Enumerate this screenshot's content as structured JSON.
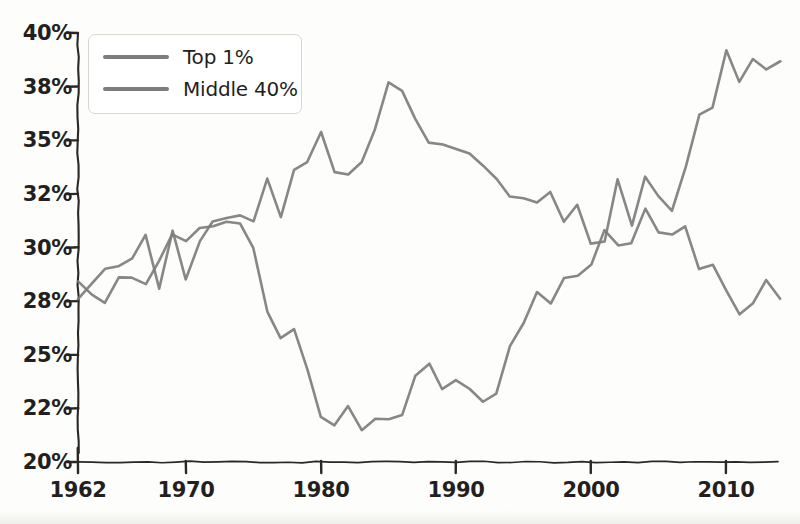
{
  "chart_data": {
    "type": "line",
    "title": "",
    "subtitle": "",
    "xlabel": "",
    "ylabel": "",
    "xlim": [
      1962,
      2014
    ],
    "ylim": [
      20,
      40
    ],
    "grid": false,
    "legend_position": "top-left",
    "x_ticks": [
      {
        "value": 1962,
        "label": "1962"
      },
      {
        "value": 1970,
        "label": "1970"
      },
      {
        "value": 1980,
        "label": "1980"
      },
      {
        "value": 1990,
        "label": "1990"
      },
      {
        "value": 2000,
        "label": "2000"
      },
      {
        "value": 2010,
        "label": "2010"
      }
    ],
    "y_ticks": [
      {
        "value": 40.0,
        "label": "40%"
      },
      {
        "value": 37.5,
        "label": "38%"
      },
      {
        "value": 35.0,
        "label": "35%"
      },
      {
        "value": 32.5,
        "label": "32%"
      },
      {
        "value": 30.0,
        "label": "30%"
      },
      {
        "value": 27.5,
        "label": "28%"
      },
      {
        "value": 25.0,
        "label": "25%"
      },
      {
        "value": 22.5,
        "label": "22%"
      },
      {
        "value": 20.0,
        "label": "20%"
      }
    ],
    "x": [
      1962,
      1963,
      1964,
      1965,
      1966,
      1967,
      1968,
      1969,
      1970,
      1971,
      1972,
      1973,
      1974,
      1975,
      1976,
      1977,
      1978,
      1979,
      1980,
      1981,
      1982,
      1983,
      1984,
      1985,
      1986,
      1987,
      1988,
      1989,
      1990,
      1991,
      1992,
      1993,
      1994,
      1995,
      1996,
      1997,
      1998,
      1999,
      2000,
      2001,
      2002,
      2003,
      2004,
      2005,
      2006,
      2007,
      2008,
      2009,
      2010,
      2011,
      2012,
      2013,
      2014
    ],
    "series": [
      {
        "name": "Top 1%",
        "color": "#7d7d7d",
        "values": [
          28.4,
          27.8,
          27.4,
          28.6,
          28.6,
          28.3,
          29.4,
          30.6,
          30.3,
          30.9,
          31.0,
          31.2,
          31.1,
          30.0,
          27.0,
          25.8,
          26.2,
          24.3,
          22.1,
          21.7,
          22.6,
          21.5,
          22.0,
          22.0,
          22.2,
          24.0,
          24.6,
          23.4,
          23.8,
          23.4,
          22.8,
          23.2,
          25.4,
          26.5,
          27.9,
          27.4,
          28.6,
          28.7,
          29.2,
          30.8,
          30.1,
          30.2,
          31.8,
          30.7,
          30.6,
          31.0,
          29.0,
          29.2,
          28.0,
          26.9,
          27.4,
          28.5,
          27.6
        ]
      },
      {
        "name": "Middle 40%",
        "color": "#7d7d7d",
        "values": [
          27.6,
          28.3,
          29.0,
          29.1,
          29.5,
          30.6,
          28.1,
          30.8,
          28.5,
          30.3,
          31.2,
          31.4,
          31.5,
          31.2,
          33.2,
          31.4,
          33.6,
          34.0,
          35.4,
          33.5,
          33.4,
          34.0,
          35.5,
          37.7,
          37.3,
          36.0,
          34.9,
          34.8,
          34.6,
          34.4,
          33.8,
          33.2,
          32.4,
          32.3,
          32.1,
          32.6,
          31.2,
          32.0,
          30.2,
          30.3,
          33.2,
          31.0,
          33.3,
          32.4,
          31.7,
          33.8,
          36.2,
          36.5,
          39.2,
          37.7,
          38.8,
          38.3,
          38.7
        ]
      }
    ]
  },
  "legend": {
    "items": [
      {
        "label": "Top 1%",
        "color": "#7d7d7d"
      },
      {
        "label": "Middle 40%",
        "color": "#7d7d7d"
      }
    ]
  },
  "colors": {
    "line": "#7d7d7d",
    "axis": "#2b2725",
    "background": "#fdfdfb",
    "tick_text": "#231f1e"
  }
}
